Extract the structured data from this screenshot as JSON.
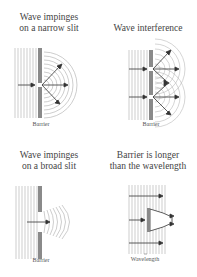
{
  "panels": [
    {
      "title_line1": "Wave impinges",
      "title_line2": "on a narrow slit",
      "label": "Barrier"
    },
    {
      "title_line1": "Wave interference",
      "title_line2": "",
      "label": "Barrier"
    },
    {
      "title_line1": "Wave impinges",
      "title_line2": "on a broad slit",
      "label": "Barrier"
    },
    {
      "title_line1": "Barrier is longer",
      "title_line2": "than the wavelength",
      "label": "Wavelength"
    }
  ],
  "colors": {
    "wavefront": "#b8b8b8",
    "barrier": "#8a8a8a",
    "arrow": "#333333",
    "text": "#444444"
  }
}
